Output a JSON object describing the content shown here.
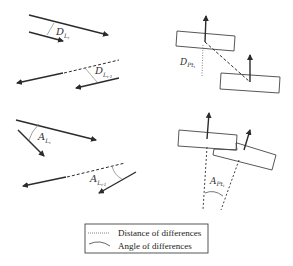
{
  "diagram": {
    "panels": [
      {
        "id": "distance-lines",
        "label_main": "D",
        "label_sub": "L",
        "label_subsub": "i",
        "label2_main": "D",
        "label2_sub": "L",
        "label2_subsub": "i-1"
      },
      {
        "id": "distance-points",
        "label_main": "D",
        "label_sub": "Pt",
        "label_subsub": "i"
      },
      {
        "id": "angle-lines",
        "label_main": "A",
        "label_sub": "L",
        "label_subsub": "i",
        "label2_main": "A",
        "label2_sub": "L",
        "label2_subsub": "i-1"
      },
      {
        "id": "angle-points",
        "label_main": "A",
        "label_sub": "Pt",
        "label_subsub": "i"
      }
    ],
    "legend": {
      "items": [
        {
          "symbol": "dotted-line",
          "label": "Distance of differences"
        },
        {
          "symbol": "arc",
          "label": "Angle of differences"
        }
      ]
    },
    "colors": {
      "line": "#2b2b2b",
      "thin": "#777777",
      "legend_border": "#444444"
    }
  }
}
